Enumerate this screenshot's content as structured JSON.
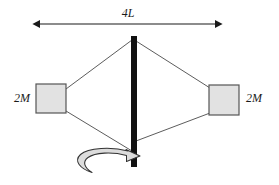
{
  "figure": {
    "background_color": "#ffffff"
  },
  "dimension_arrow": {
    "label": "4L",
    "label_x": 128,
    "label_y": 14,
    "line_y": 24,
    "x_start": 33,
    "x_end": 222,
    "color": "#1a1a1a"
  },
  "bar": {
    "name": "rotation-axis-bar",
    "x": 131,
    "y": 36,
    "width": 6,
    "height": 131,
    "color": "#111111"
  },
  "blocks": [
    {
      "id": "left-block",
      "label": "2M",
      "x": 36,
      "y": 84,
      "width": 30,
      "height": 29,
      "fill": "#e2e2e2",
      "stroke": "#555555",
      "label_x": 22,
      "label_y": 99,
      "label_anchor": "middle"
    },
    {
      "id": "right-block",
      "label": "2M",
      "x": 209,
      "y": 85,
      "width": 30,
      "height": 30,
      "fill": "#e2e2e2",
      "stroke": "#555555",
      "label_x": 254,
      "label_y": 99,
      "label_anchor": "middle"
    }
  ],
  "cords": [
    {
      "id": "cord-top-left",
      "x1": 132,
      "y1": 40,
      "x2": 66,
      "y2": 89
    },
    {
      "id": "cord-bottom-left",
      "x1": 66,
      "y1": 111,
      "x2": 132,
      "y2": 151
    },
    {
      "id": "cord-top-right",
      "x1": 136,
      "y1": 41,
      "x2": 210,
      "y2": 88
    },
    {
      "id": "cord-bottom-right",
      "x1": 136,
      "y1": 141,
      "x2": 210,
      "y2": 113
    }
  ],
  "cord_color": "#4a4a4a",
  "rotation_arrow": {
    "name": "rotation-direction-arrow",
    "center_x": 103,
    "center_y": 163,
    "fill": "#dcdcdc",
    "stroke": "#333333"
  }
}
